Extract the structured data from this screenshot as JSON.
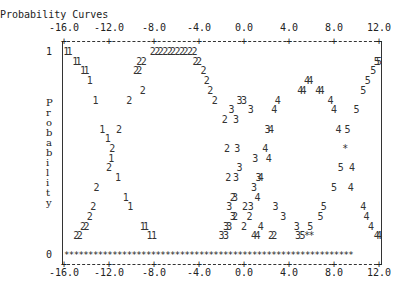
{
  "chart_data": {
    "type": "scatter",
    "title": "Probability Curves",
    "ylabel": "Probability",
    "xlabel": "",
    "xlim": [
      -16.0,
      12.0
    ],
    "ylim": [
      0,
      1
    ],
    "x_ticks": [
      "-16.0",
      "-12.0",
      "-8.0",
      "-4.0",
      "0.0",
      "4.0",
      "8.0",
      "12.0"
    ],
    "x_tick_values": [
      -16,
      -12,
      -8,
      -4,
      0,
      4,
      8,
      12
    ],
    "y_ticks": [
      "1",
      "0"
    ],
    "y_tick_values": [
      1,
      0
    ],
    "ylabel_chars": [
      "P",
      "r",
      "o",
      "b",
      "a",
      "b",
      "i",
      "l",
      "i",
      "t",
      "y"
    ],
    "legend": "curves labeled by plotting symbols 1-5; '*' marks overlaps",
    "baseline_symbol": "*",
    "series": [
      {
        "name": "1",
        "points": [
          [
            -15.8,
            1.0
          ],
          [
            -15.5,
            1.0
          ],
          [
            -15.0,
            0.95
          ],
          [
            -14.7,
            0.95
          ],
          [
            -14.3,
            0.9
          ],
          [
            -14.0,
            0.9
          ],
          [
            -13.7,
            0.85
          ],
          [
            -13.2,
            0.75
          ],
          [
            -12.6,
            0.6
          ],
          [
            -12.1,
            0.55
          ],
          [
            -11.8,
            0.45
          ],
          [
            -11.2,
            0.35
          ],
          [
            -10.5,
            0.25
          ],
          [
            -10.1,
            0.2
          ],
          [
            -9.0,
            0.1
          ],
          [
            -8.7,
            0.1
          ],
          [
            -8.4,
            0.05
          ],
          [
            -8.0,
            0.05
          ]
        ]
      },
      {
        "name": "2",
        "points": [
          [
            -8.1,
            1.0
          ],
          [
            -7.7,
            1.0
          ],
          [
            -7.4,
            1.0
          ],
          [
            -7.0,
            1.0
          ],
          [
            -6.6,
            1.0
          ],
          [
            -6.3,
            1.0
          ],
          [
            -5.9,
            1.0
          ],
          [
            -5.5,
            1.0
          ],
          [
            -5.2,
            1.0
          ],
          [
            -4.8,
            1.0
          ],
          [
            -4.4,
            1.0
          ],
          [
            -9.3,
            0.95
          ],
          [
            -8.9,
            0.95
          ],
          [
            -4.3,
            0.95
          ],
          [
            -4.0,
            0.95
          ],
          [
            -9.6,
            0.9
          ],
          [
            -9.3,
            0.9
          ],
          [
            -3.6,
            0.9
          ],
          [
            -3.3,
            0.85
          ],
          [
            -9.0,
            0.8
          ],
          [
            -3.0,
            0.8
          ],
          [
            -10.2,
            0.75
          ],
          [
            -2.6,
            0.75
          ],
          [
            -11.1,
            0.6
          ],
          [
            -1.7,
            0.65
          ],
          [
            -11.7,
            0.5
          ],
          [
            -1.5,
            0.5
          ],
          [
            -12.0,
            0.4
          ],
          [
            -13.1,
            0.3
          ],
          [
            -1.4,
            0.35
          ],
          [
            -13.4,
            0.2
          ],
          [
            -1.0,
            0.25
          ],
          [
            -13.7,
            0.15
          ],
          [
            -0.8,
            0.15
          ],
          [
            -14.0,
            0.1
          ],
          [
            -14.3,
            0.1
          ],
          [
            0.0,
            0.1
          ],
          [
            -14.6,
            0.05
          ],
          [
            -14.9,
            0.05
          ],
          [
            2.4,
            0.05
          ],
          [
            2.7,
            0.05
          ],
          [
            0.5,
            0.15
          ],
          [
            0.1,
            0.2
          ]
        ]
      },
      {
        "name": "3",
        "points": [
          [
            -0.4,
            0.75
          ],
          [
            0.0,
            0.75
          ],
          [
            -1.1,
            0.7
          ],
          [
            0.6,
            0.7
          ],
          [
            -0.7,
            0.65
          ],
          [
            -0.6,
            0.5
          ],
          [
            2.1,
            0.6
          ],
          [
            1.0,
            0.45
          ],
          [
            -0.4,
            0.4
          ],
          [
            1.3,
            0.35
          ],
          [
            -0.7,
            0.35
          ],
          [
            0.9,
            0.3
          ],
          [
            -0.8,
            0.25
          ],
          [
            0.6,
            0.2
          ],
          [
            -1.0,
            0.15
          ],
          [
            -1.3,
            0.1
          ],
          [
            -1.6,
            0.05
          ],
          [
            -2.0,
            0.05
          ],
          [
            -1.6,
            0.1
          ],
          [
            -1.3,
            0.2
          ],
          [
            2.8,
            0.2
          ],
          [
            3.5,
            0.15
          ],
          [
            4.8,
            0.05
          ],
          [
            4.7,
            0.1
          ]
        ]
      },
      {
        "name": "4",
        "points": [
          [
            5.6,
            0.85
          ],
          [
            5.9,
            0.85
          ],
          [
            5.0,
            0.8
          ],
          [
            5.3,
            0.8
          ],
          [
            6.6,
            0.8
          ],
          [
            6.9,
            0.8
          ],
          [
            3.0,
            0.75
          ],
          [
            7.7,
            0.75
          ],
          [
            2.7,
            0.7
          ],
          [
            8.0,
            0.7
          ],
          [
            2.4,
            0.6
          ],
          [
            8.4,
            0.6
          ],
          [
            1.9,
            0.5
          ],
          [
            2.2,
            0.45
          ],
          [
            9.6,
            0.4
          ],
          [
            1.5,
            0.35
          ],
          [
            9.5,
            0.3
          ],
          [
            1.2,
            0.25
          ],
          [
            10.6,
            0.2
          ],
          [
            10.9,
            0.15
          ],
          [
            11.3,
            0.1
          ],
          [
            11.8,
            0.05
          ],
          [
            12.0,
            0.05
          ],
          [
            1.5,
            0.1
          ],
          [
            0.9,
            0.05
          ],
          [
            1.2,
            0.05
          ]
        ]
      },
      {
        "name": "5",
        "points": [
          [
            11.8,
            0.95
          ],
          [
            12.0,
            0.95
          ],
          [
            11.5,
            0.9
          ],
          [
            11.0,
            0.85
          ],
          [
            10.6,
            0.8
          ],
          [
            10.0,
            0.7
          ],
          [
            9.2,
            0.6
          ],
          [
            8.6,
            0.4
          ],
          [
            8.0,
            0.3
          ],
          [
            7.1,
            0.2
          ],
          [
            6.8,
            0.15
          ],
          [
            5.9,
            0.1
          ],
          [
            5.2,
            0.05
          ]
        ]
      },
      {
        "name": "*",
        "points": [
          [
            9.0,
            0.5
          ],
          [
            5.6,
            0.05
          ],
          [
            6.0,
            0.05
          ]
        ]
      }
    ]
  }
}
